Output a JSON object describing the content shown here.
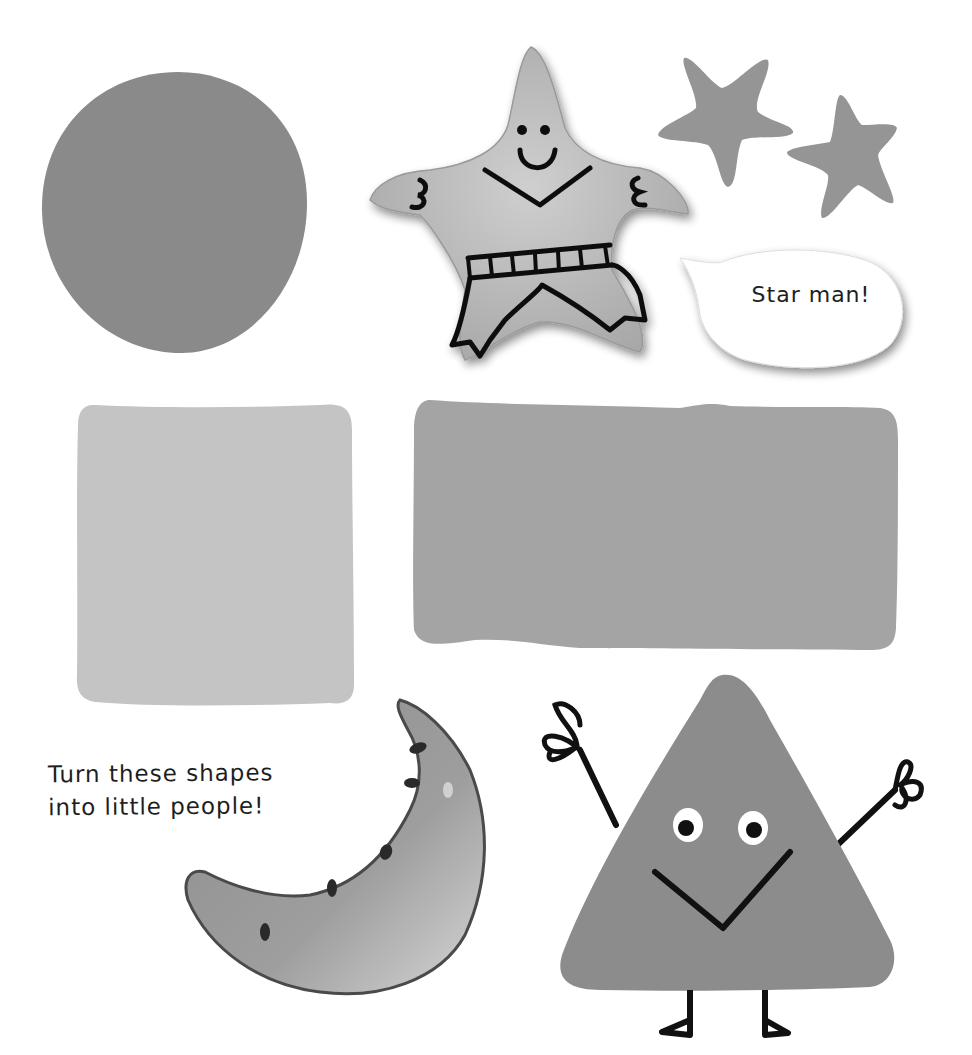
{
  "page": {
    "background": "#ffffff",
    "colors": {
      "circle": "#8a8a8a",
      "square": "#c4c4c4",
      "rectangle": "#a4a4a4",
      "small_stars": "#959595",
      "triangle": "#8c8c8c",
      "felt_star": "#b9b9b9",
      "melon": "#9a9a9a",
      "ink": "#1a1a1a"
    }
  },
  "shapes": [
    {
      "name": "circle",
      "label": "Circle"
    },
    {
      "name": "star-man",
      "label": "Felt star man"
    },
    {
      "name": "small-star-1",
      "label": "Star"
    },
    {
      "name": "small-star-2",
      "label": "Star"
    },
    {
      "name": "square",
      "label": "Square"
    },
    {
      "name": "rectangle",
      "label": "Rectangle"
    },
    {
      "name": "crescent",
      "label": "Watermelon crescent"
    },
    {
      "name": "triangle-person",
      "label": "Triangle person"
    }
  ],
  "speech_bubble": {
    "text": "Star man!"
  },
  "caption": {
    "line1": "Turn these shapes",
    "line2": "into little people!"
  }
}
